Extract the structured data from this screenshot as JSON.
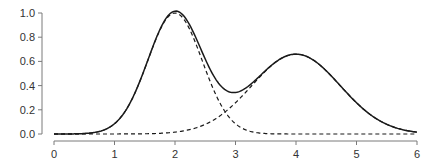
{
  "chart_data": {
    "type": "line",
    "title": "",
    "xlabel": "",
    "ylabel": "",
    "xlim": [
      0,
      6
    ],
    "ylim": [
      0,
      1.0
    ],
    "x_ticks": [
      "0",
      "1",
      "2",
      "3",
      "4",
      "5",
      "6"
    ],
    "y_ticks": [
      "0.0",
      "0.2",
      "0.4",
      "0.6",
      "0.8",
      "1.0"
    ],
    "grid": false,
    "legend": null,
    "series": [
      {
        "name": "sum",
        "style": "solid",
        "description": "Sum of two Gaussian components",
        "x": [
          0,
          0.5,
          1.0,
          1.5,
          2.0,
          2.5,
          2.9,
          3.0,
          3.5,
          4.0,
          4.5,
          5.0,
          5.5,
          6.0
        ],
        "values": [
          0.0,
          0.0,
          0.09,
          0.56,
          1.0,
          0.57,
          0.23,
          0.23,
          0.43,
          0.66,
          0.52,
          0.26,
          0.08,
          0.02
        ]
      },
      {
        "name": "component-1",
        "style": "dashed",
        "description": "Gaussian centered at x=2, peak 1.0",
        "center": 2.0,
        "amplitude": 1.0,
        "sigma": 0.45
      },
      {
        "name": "component-2",
        "style": "dashed",
        "description": "Gaussian centered at x=4, peak ~0.66",
        "center": 4.0,
        "amplitude": 0.66,
        "sigma": 0.73
      }
    ],
    "plot_area_px": {
      "x0": 54,
      "x1": 417,
      "y0": 134,
      "y1": 13
    }
  }
}
